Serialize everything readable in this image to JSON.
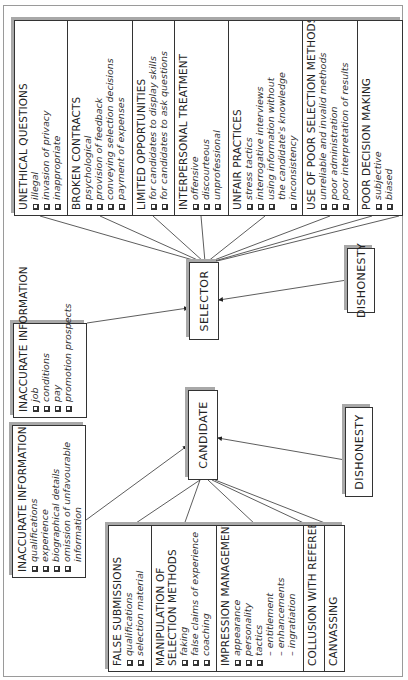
{
  "selector": {
    "label": "SELECTOR",
    "inaccurate_information": {
      "title": "INACCURATE INFORMATION",
      "items": [
        "job",
        "conditions",
        "pay",
        "promotion prospects"
      ]
    },
    "dishonesty": "DISHONESTY",
    "panel": [
      {
        "title": "UNETHICAL QUESTIONS",
        "items": [
          "illegal",
          "invasion of privacy",
          "inappropriate"
        ]
      },
      {
        "title": "BROKEN CONTRACTS",
        "items": [
          "psychological",
          "provision of feedback",
          "conveying selection decisions",
          "payment of expenses"
        ]
      },
      {
        "title": "LIMITED OPPORTUNITIES",
        "items": [
          "for candidates to display skills",
          "for candidates to ask questions"
        ]
      },
      {
        "title": "INTERPERSONAL TREATMENT",
        "items": [
          "offensive",
          "discourteous",
          "unprofessional"
        ]
      },
      {
        "title": "UNFAIR PRACTICES",
        "items": [
          "stress tactics",
          "interrogative interviews",
          "using information without",
          "inconsistency"
        ],
        "continuation": "the candidate's knowledge"
      },
      {
        "title": "USE OF POOR SELECTION METHODS",
        "items": [
          "unreliable and invalid methods",
          "poor administration",
          "poor interpretation of results"
        ]
      },
      {
        "title": "POOR DECISION MAKING",
        "items": [
          "subjective",
          "biased"
        ]
      }
    ]
  },
  "candidate": {
    "label": "CANDIDATE",
    "inaccurate_information": {
      "title": "INACCURATE INFORMATION",
      "items": [
        "qualifications",
        "experience",
        "biographical details",
        "omission of unfavourable"
      ],
      "continuation": "information"
    },
    "dishonesty": "DISHONESTY",
    "panel": [
      {
        "title": "FALSE SUBMISSIONS",
        "items": [
          "qualifications",
          "selection material"
        ]
      },
      {
        "title_lines": [
          "MANIPULATION OF",
          "SELECTION METHODS"
        ],
        "items": [
          "faking",
          "false claims of experience",
          "coaching"
        ]
      },
      {
        "title": "IMPRESSION MANAGEMENT",
        "items": [
          "appearance",
          "personality",
          "tactics"
        ],
        "subitems": [
          "– entitlement",
          "– enhancements",
          "– ingratiation"
        ]
      },
      {
        "title": "COLLUSION WITH REFEREES",
        "items": []
      },
      {
        "title": "CANVASSING",
        "items": []
      }
    ]
  }
}
